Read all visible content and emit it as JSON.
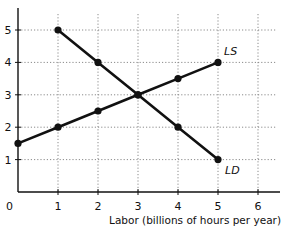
{
  "chart_data": {
    "type": "line",
    "title": "",
    "xlabel": "Labor (billions of hours per year)",
    "ylabel": "",
    "xlim": [
      0,
      6
    ],
    "ylim": [
      0,
      5
    ],
    "x_ticks": [
      "0",
      "1",
      "2",
      "3",
      "4",
      "5",
      "6"
    ],
    "y_ticks": [
      "1",
      "2",
      "3",
      "4",
      "5"
    ],
    "grid": "dotted",
    "legend": "none (direct curve labels)",
    "series": [
      {
        "name": "LS",
        "label": "LS",
        "points": [
          [
            0,
            1.5
          ],
          [
            1,
            2
          ],
          [
            2,
            2.5
          ],
          [
            3,
            3
          ],
          [
            4,
            3.5
          ],
          [
            5,
            4
          ]
        ]
      },
      {
        "name": "LD",
        "label": "LD",
        "points": [
          [
            1,
            5
          ],
          [
            2,
            4
          ],
          [
            3,
            3
          ],
          [
            4,
            2
          ],
          [
            5,
            1
          ]
        ]
      }
    ],
    "equilibrium": [
      3,
      3
    ]
  },
  "axis": {
    "origin_label": "0",
    "x_label": "Labor (billions of hours per year)"
  },
  "colors": {
    "line": "#111111",
    "grid": "#8a8a8a",
    "background": "#ffffff"
  }
}
